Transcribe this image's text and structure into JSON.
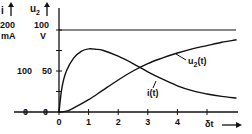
{
  "chart_data": {
    "type": "line",
    "title": "",
    "xlabel": "δt",
    "ylabel_left_outer": {
      "symbol": "i",
      "max_label": "200",
      "unit": "mA"
    },
    "ylabel_left_inner": {
      "symbol": "u2",
      "max_label": "100",
      "unit": "V"
    },
    "x_ticks": [
      0,
      1,
      2,
      3,
      4,
      5
    ],
    "y_ticks_inner": [
      0,
      50,
      100
    ],
    "y_ticks_outer": [
      0,
      100,
      200
    ],
    "xlim": [
      0,
      6
    ],
    "ylim_inner": [
      0,
      100
    ],
    "ylim_outer": [
      0,
      200
    ],
    "asymptote": {
      "y_inner": 100,
      "label": ""
    },
    "grid": false,
    "series": [
      {
        "name": "u2(t)",
        "axis": "inner",
        "x": [
          0,
          0.25,
          0.5,
          1.0,
          1.5,
          2.0,
          2.5,
          3.0,
          3.5,
          4.0,
          4.5,
          5.0,
          5.5,
          6.0
        ],
        "values": [
          0,
          1,
          5,
          15,
          27,
          39,
          50,
          59,
          66,
          72,
          77,
          81,
          85,
          88
        ]
      },
      {
        "name": "i(t)",
        "axis": "outer",
        "x": [
          0,
          0.1,
          0.25,
          0.5,
          0.75,
          1.0,
          1.25,
          1.5,
          2.0,
          2.5,
          3.0,
          3.5,
          4.0,
          4.5,
          5.0,
          5.5,
          6.0
        ],
        "values": [
          0,
          60,
          100,
          132,
          148,
          154,
          153,
          150,
          136,
          118,
          98,
          80,
          64,
          52,
          44,
          38,
          34
        ]
      }
    ],
    "annotations": [
      {
        "text": "u2(t)",
        "target": "u2(t)"
      },
      {
        "text": "i(t)",
        "target": "i(t)"
      }
    ]
  },
  "labels": {
    "i_symbol": "i",
    "u_symbol": "u",
    "u_sub": "2",
    "i_max": "200",
    "i_unit": "mA",
    "u_max": "100",
    "u_unit": "V",
    "i_mid": "100",
    "u_mid": "50",
    "i_zero": "0",
    "u_zero": "0",
    "x_label": "δt",
    "u2_curve_label": "u",
    "u2_curve_sub": "2",
    "u2_curve_suffix": "(t)",
    "i_curve_label": "i(t)"
  }
}
